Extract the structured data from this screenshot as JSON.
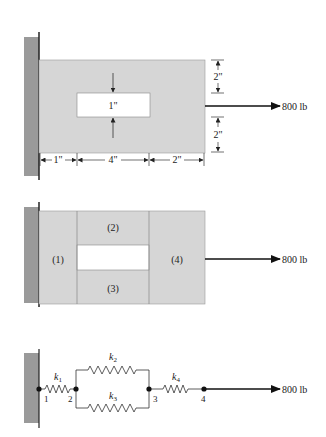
{
  "colors": {
    "plate": "#d6d6d6",
    "wall": "#9a9a9a",
    "line": "#333333",
    "hole": "#ffffff"
  },
  "diagram1": {
    "load_label": "800 lb",
    "hole_label": "1\"",
    "dims_horizontal": [
      "1\"",
      "4\"",
      "2\""
    ],
    "dims_vertical": [
      "2\"",
      "2\""
    ]
  },
  "diagram2": {
    "load_label": "800 lb",
    "regions": [
      "(1)",
      "(2)",
      "(3)",
      "(4)"
    ]
  },
  "diagram3": {
    "load_label": "800 lb",
    "springs": [
      "k",
      "k",
      "k",
      "k"
    ],
    "spring_subscripts": [
      "1",
      "2",
      "3",
      "4"
    ],
    "nodes": [
      "1",
      "2",
      "3",
      "4"
    ]
  }
}
